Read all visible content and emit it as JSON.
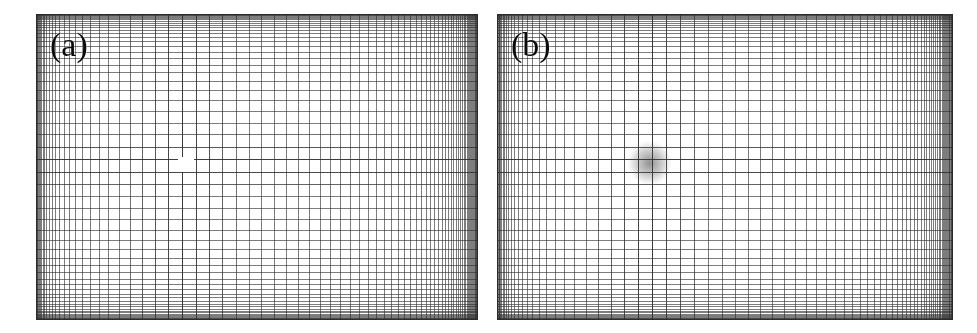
{
  "figure": {
    "type": "computational-mesh-figure",
    "background_color": "#ffffff",
    "width": 977,
    "height": 333,
    "panel_gap_px": 19
  },
  "panels": [
    {
      "id": "panel-a",
      "label": "(a)",
      "label_x": 14,
      "label_y": 14,
      "frame": {
        "x": 36,
        "y": 14,
        "width": 442,
        "height": 306
      },
      "grid": {
        "type": "stretched-cartesian",
        "nx": 78,
        "ny": 56,
        "stretch_x": 2.35,
        "stretch_y": 2.25,
        "cluster_center_x": 0.335,
        "cluster_center_y": 0.487,
        "line_color": "#3c3c3c",
        "line_width": 1,
        "background_color": "#ffffff"
      },
      "void": {
        "present": true,
        "name": "square-obstacle",
        "x": 178,
        "y": 157,
        "width": 16,
        "height": 15,
        "color": "#ffffff"
      }
    },
    {
      "id": "panel-b",
      "label": "(b)",
      "label_x": 14,
      "label_y": 14,
      "frame": {
        "x": 497,
        "y": 14,
        "width": 456,
        "height": 306
      },
      "grid": {
        "type": "stretched-cartesian",
        "nx": 80,
        "ny": 56,
        "stretch_x": 2.45,
        "stretch_y": 2.25,
        "cluster_center_x": 0.335,
        "cluster_center_y": 0.487,
        "line_color": "#3c3c3c",
        "line_width": 1,
        "background_color": "#ffffff"
      },
      "void": {
        "present": false,
        "name": "dense-core-cluster",
        "x": 644,
        "y": 155,
        "width": 22,
        "height": 20,
        "color": "#4a4a4a"
      }
    }
  ],
  "chart_data": {
    "type": "heatmap",
    "title": "",
    "xlabel": "",
    "ylabel": "",
    "legend_position": "none",
    "grid": true,
    "annotations": [
      "(a)",
      "(b)"
    ],
    "series": [
      {
        "name": "(a) mesh with square void",
        "nx": 78,
        "ny": 56,
        "clustering": "hyperbolic-tangent toward centre",
        "cluster_fraction_x": 0.335,
        "cluster_fraction_y": 0.487
      },
      {
        "name": "(b) mesh with refined core",
        "nx": 80,
        "ny": 56,
        "clustering": "hyperbolic-tangent toward centre",
        "cluster_fraction_x": 0.335,
        "cluster_fraction_y": 0.487
      }
    ]
  }
}
